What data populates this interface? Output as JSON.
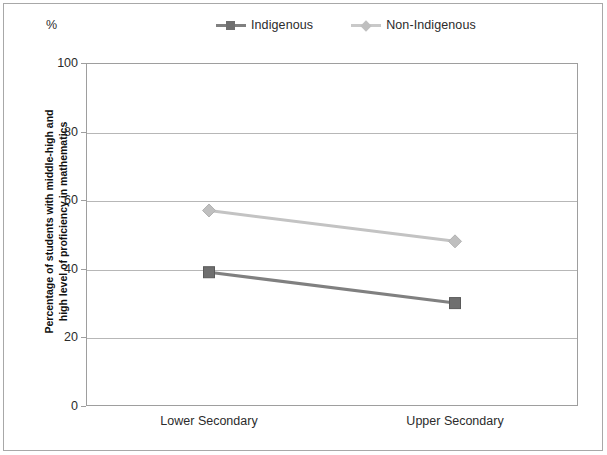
{
  "figure": {
    "unit_label": "%",
    "y_axis_title_line1": "Percentage of students with middle-high and",
    "y_axis_title_line2": "high level of proficiency in mathematics"
  },
  "legend": {
    "position": "top-center",
    "entries": [
      {
        "label": "Indigenous",
        "color": "#808080",
        "marker": "square"
      },
      {
        "label": "Non-Indigenous",
        "color": "#c3c3c3",
        "marker": "diamond"
      }
    ]
  },
  "chart_data": {
    "type": "line",
    "title": "",
    "subtitle": "",
    "xlabel": "",
    "ylabel": "Percentage of students with middle-high and high level of proficiency in mathematics",
    "unit": "%",
    "categories": [
      "Lower Secondary",
      "Upper Secondary"
    ],
    "ylim": [
      0,
      100
    ],
    "yticks": [
      0,
      20,
      40,
      60,
      80,
      100
    ],
    "ytick_labels": [
      "0",
      "20",
      "40",
      "60",
      "80",
      "100"
    ],
    "grid": true,
    "grid_axis": "y",
    "legend_position": "top-center",
    "series": [
      {
        "name": "Indigenous",
        "color": "#808080",
        "marker": "square",
        "values": [
          39,
          30
        ]
      },
      {
        "name": "Non-Indigenous",
        "color": "#c3c3c3",
        "marker": "diamond",
        "values": [
          57,
          48
        ]
      }
    ]
  }
}
